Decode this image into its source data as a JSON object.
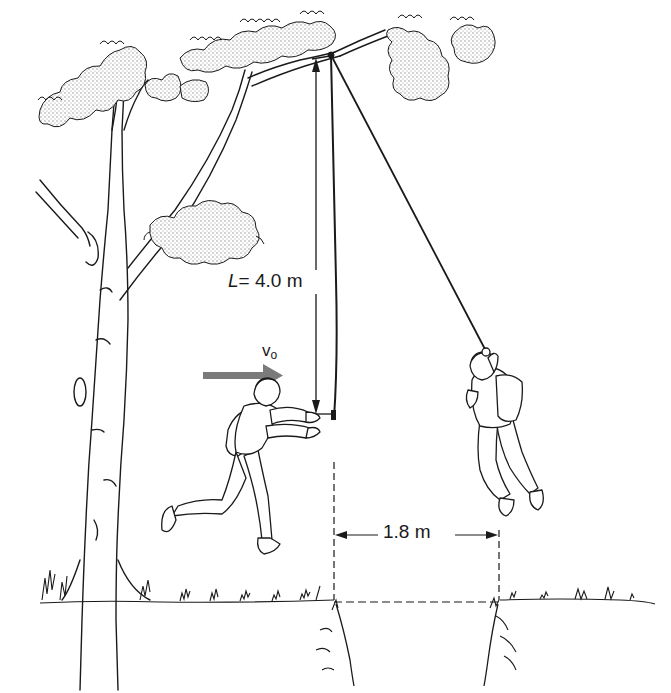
{
  "figure": {
    "labels": {
      "rope_length_symbol": "L",
      "rope_length_value": "= 4.0 m",
      "initial_velocity_symbol": "v",
      "initial_velocity_subscript": "o",
      "horizontal_distance": "1.8 m"
    },
    "quantities": {
      "rope_length_m": 4.0,
      "horizontal_displacement_m": 1.8
    },
    "colors": {
      "line": "#1a1a1a",
      "velocity_arrow": "#7a7a7a",
      "foliage_shade": "#bdbdbd",
      "background": "#ffffff"
    },
    "elements": [
      "tree-with-branch",
      "rope-hanging-vertical",
      "rope-swung",
      "runner-person",
      "swinging-person",
      "velocity-arrow",
      "length-dimension-arrow",
      "distance-dimension-arrow",
      "ground-with-ditch"
    ]
  }
}
